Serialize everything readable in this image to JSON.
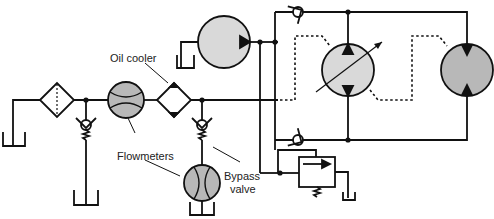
{
  "diagram": {
    "type": "hydraulic-schematic",
    "labels": {
      "oil_cooler": "Oil cooler",
      "flowmeters": "Flowmeters",
      "bypass_valve_line1": "Bypass",
      "bypass_valve_line2": "valve"
    },
    "colors": {
      "line": "#111111",
      "fill_light": "#d9d9d9",
      "fill_dark": "#b8b8b8"
    },
    "components": [
      {
        "name": "reservoir",
        "count": 5
      },
      {
        "name": "filter"
      },
      {
        "name": "flowmeter",
        "count": 2
      },
      {
        "name": "oil-cooler"
      },
      {
        "name": "check-valve",
        "count": 4
      },
      {
        "name": "charge-pump"
      },
      {
        "name": "variable-displacement-pump"
      },
      {
        "name": "fixed-displacement-motor"
      },
      {
        "name": "relief-valve"
      }
    ]
  }
}
